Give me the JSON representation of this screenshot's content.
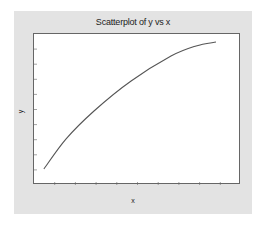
{
  "chart_data": {
    "type": "line",
    "title": "Scatterplot of y vs x",
    "xlabel": "x",
    "ylabel": "y",
    "xlim": [
      0,
      10
    ],
    "ylim": [
      0,
      10
    ],
    "grid": false,
    "legend": null,
    "tick_labels_visible": false,
    "series": [
      {
        "name": "y",
        "x": [
          0.48,
          1.55,
          2.9,
          4.69,
          6.62,
          7.83,
          8.79
        ],
        "y": [
          1.06,
          3.05,
          4.9,
          6.89,
          8.54,
          9.21,
          9.47
        ]
      }
    ]
  },
  "colors": {
    "frame": "#e3e3e3",
    "plot_bg": "#ffffff",
    "line": "#555555",
    "axis": "#666666"
  }
}
